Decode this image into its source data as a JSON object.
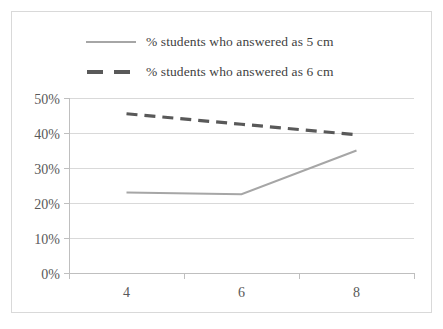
{
  "chart_data": {
    "type": "line",
    "title": "",
    "xlabel": "",
    "ylabel": "",
    "categories": [
      "4",
      "6",
      "8"
    ],
    "series": [
      {
        "name": "% students who answered as 5 cm",
        "values": [
          23,
          22.5,
          35
        ],
        "style": "solid",
        "color": "#a6a6a6"
      },
      {
        "name": "% students who answered as 6 cm",
        "values": [
          45.5,
          42.5,
          39.5
        ],
        "style": "dashed",
        "color": "#595959"
      }
    ],
    "ylim": [
      0,
      50
    ],
    "y_ticks": [
      "0%",
      "10%",
      "20%",
      "30%",
      "40%",
      "50%"
    ],
    "y_tick_values": [
      0,
      10,
      20,
      30,
      40,
      50
    ],
    "grid": "horizontal",
    "legend_position": "top"
  },
  "legend": {
    "items": [
      {
        "label": "% students who answered as 5 cm",
        "marker": "solid-line-swatch"
      },
      {
        "label": "% students who answered as 6 cm",
        "marker": "dashed-line-swatch"
      }
    ]
  },
  "colors": {
    "border": "#d9d9d9",
    "gridline": "#d9d9d9",
    "axis": "#bfbfbf",
    "text": "#595959",
    "series_solid": "#a6a6a6",
    "series_dashed": "#595959",
    "background": "#ffffff"
  }
}
